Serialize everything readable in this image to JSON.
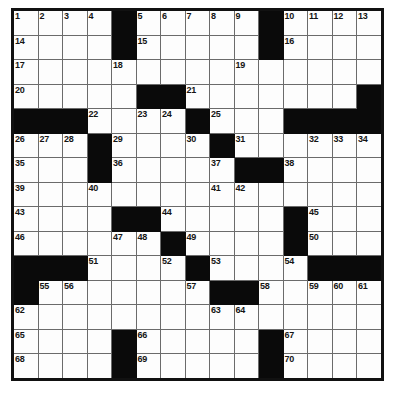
{
  "puzzle": {
    "type": "crossword-grid",
    "title": "",
    "rows": 15,
    "columns": 15,
    "colors": {
      "block": "#0a0a0a",
      "cell": "#fdfdfd",
      "grid_line": "#6b6b6b",
      "outer_border": "#111111",
      "number_text": "#141414"
    },
    "grid": [
      [
        {
          "block": false,
          "num": "1"
        },
        {
          "block": false,
          "num": "2"
        },
        {
          "block": false,
          "num": "3"
        },
        {
          "block": false,
          "num": "4"
        },
        {
          "block": true,
          "num": ""
        },
        {
          "block": false,
          "num": "5"
        },
        {
          "block": false,
          "num": "6"
        },
        {
          "block": false,
          "num": "7"
        },
        {
          "block": false,
          "num": "8"
        },
        {
          "block": false,
          "num": "9"
        },
        {
          "block": true,
          "num": ""
        },
        {
          "block": false,
          "num": "10"
        },
        {
          "block": false,
          "num": "11"
        },
        {
          "block": false,
          "num": "12"
        },
        {
          "block": false,
          "num": "13"
        }
      ],
      [
        {
          "block": false,
          "num": "14"
        },
        {
          "block": false,
          "num": ""
        },
        {
          "block": false,
          "num": ""
        },
        {
          "block": false,
          "num": ""
        },
        {
          "block": true,
          "num": ""
        },
        {
          "block": false,
          "num": "15"
        },
        {
          "block": false,
          "num": ""
        },
        {
          "block": false,
          "num": ""
        },
        {
          "block": false,
          "num": ""
        },
        {
          "block": false,
          "num": ""
        },
        {
          "block": true,
          "num": ""
        },
        {
          "block": false,
          "num": "16"
        },
        {
          "block": false,
          "num": ""
        },
        {
          "block": false,
          "num": ""
        },
        {
          "block": false,
          "num": ""
        }
      ],
      [
        {
          "block": false,
          "num": "17"
        },
        {
          "block": false,
          "num": ""
        },
        {
          "block": false,
          "num": ""
        },
        {
          "block": false,
          "num": ""
        },
        {
          "block": false,
          "num": "18"
        },
        {
          "block": false,
          "num": ""
        },
        {
          "block": false,
          "num": ""
        },
        {
          "block": false,
          "num": ""
        },
        {
          "block": false,
          "num": ""
        },
        {
          "block": false,
          "num": "19"
        },
        {
          "block": false,
          "num": ""
        },
        {
          "block": false,
          "num": ""
        },
        {
          "block": false,
          "num": ""
        },
        {
          "block": false,
          "num": ""
        },
        {
          "block": false,
          "num": ""
        }
      ],
      [
        {
          "block": false,
          "num": "20"
        },
        {
          "block": false,
          "num": ""
        },
        {
          "block": false,
          "num": ""
        },
        {
          "block": false,
          "num": ""
        },
        {
          "block": false,
          "num": ""
        },
        {
          "block": true,
          "num": ""
        },
        {
          "block": true,
          "num": ""
        },
        {
          "block": false,
          "num": "21"
        },
        {
          "block": false,
          "num": ""
        },
        {
          "block": false,
          "num": ""
        },
        {
          "block": false,
          "num": ""
        },
        {
          "block": false,
          "num": ""
        },
        {
          "block": false,
          "num": ""
        },
        {
          "block": false,
          "num": ""
        },
        {
          "block": true,
          "num": ""
        }
      ],
      [
        {
          "block": true,
          "num": ""
        },
        {
          "block": true,
          "num": ""
        },
        {
          "block": true,
          "num": ""
        },
        {
          "block": false,
          "num": "22"
        },
        {
          "block": false,
          "num": ""
        },
        {
          "block": false,
          "num": "23"
        },
        {
          "block": false,
          "num": "24"
        },
        {
          "block": true,
          "num": ""
        },
        {
          "block": false,
          "num": "25"
        },
        {
          "block": false,
          "num": ""
        },
        {
          "block": false,
          "num": ""
        },
        {
          "block": true,
          "num": ""
        },
        {
          "block": true,
          "num": ""
        },
        {
          "block": true,
          "num": ""
        },
        {
          "block": true,
          "num": ""
        }
      ],
      [
        {
          "block": false,
          "num": "26"
        },
        {
          "block": false,
          "num": "27"
        },
        {
          "block": false,
          "num": "28"
        },
        {
          "block": true,
          "num": ""
        },
        {
          "block": false,
          "num": "29"
        },
        {
          "block": false,
          "num": ""
        },
        {
          "block": false,
          "num": ""
        },
        {
          "block": false,
          "num": "30"
        },
        {
          "block": true,
          "num": ""
        },
        {
          "block": false,
          "num": "31"
        },
        {
          "block": false,
          "num": ""
        },
        {
          "block": false,
          "num": ""
        },
        {
          "block": false,
          "num": "32"
        },
        {
          "block": false,
          "num": "33"
        },
        {
          "block": false,
          "num": "34"
        }
      ],
      [
        {
          "block": false,
          "num": "35"
        },
        {
          "block": false,
          "num": ""
        },
        {
          "block": false,
          "num": ""
        },
        {
          "block": true,
          "num": ""
        },
        {
          "block": false,
          "num": "36"
        },
        {
          "block": false,
          "num": ""
        },
        {
          "block": false,
          "num": ""
        },
        {
          "block": false,
          "num": ""
        },
        {
          "block": false,
          "num": "37"
        },
        {
          "block": true,
          "num": ""
        },
        {
          "block": true,
          "num": ""
        },
        {
          "block": false,
          "num": "38"
        },
        {
          "block": false,
          "num": ""
        },
        {
          "block": false,
          "num": ""
        },
        {
          "block": false,
          "num": ""
        }
      ],
      [
        {
          "block": false,
          "num": "39"
        },
        {
          "block": false,
          "num": ""
        },
        {
          "block": false,
          "num": ""
        },
        {
          "block": false,
          "num": "40"
        },
        {
          "block": false,
          "num": ""
        },
        {
          "block": false,
          "num": ""
        },
        {
          "block": false,
          "num": ""
        },
        {
          "block": false,
          "num": ""
        },
        {
          "block": false,
          "num": "41"
        },
        {
          "block": false,
          "num": "42"
        },
        {
          "block": false,
          "num": ""
        },
        {
          "block": false,
          "num": ""
        },
        {
          "block": false,
          "num": ""
        },
        {
          "block": false,
          "num": ""
        },
        {
          "block": false,
          "num": ""
        }
      ],
      [
        {
          "block": false,
          "num": "43"
        },
        {
          "block": false,
          "num": ""
        },
        {
          "block": false,
          "num": ""
        },
        {
          "block": false,
          "num": ""
        },
        {
          "block": true,
          "num": ""
        },
        {
          "block": true,
          "num": ""
        },
        {
          "block": false,
          "num": "44"
        },
        {
          "block": false,
          "num": ""
        },
        {
          "block": false,
          "num": ""
        },
        {
          "block": false,
          "num": ""
        },
        {
          "block": false,
          "num": ""
        },
        {
          "block": true,
          "num": ""
        },
        {
          "block": false,
          "num": "45"
        },
        {
          "block": false,
          "num": ""
        },
        {
          "block": false,
          "num": ""
        }
      ],
      [
        {
          "block": false,
          "num": "46"
        },
        {
          "block": false,
          "num": ""
        },
        {
          "block": false,
          "num": ""
        },
        {
          "block": false,
          "num": ""
        },
        {
          "block": false,
          "num": "47"
        },
        {
          "block": false,
          "num": "48"
        },
        {
          "block": true,
          "num": ""
        },
        {
          "block": false,
          "num": "49"
        },
        {
          "block": false,
          "num": ""
        },
        {
          "block": false,
          "num": ""
        },
        {
          "block": false,
          "num": ""
        },
        {
          "block": true,
          "num": ""
        },
        {
          "block": false,
          "num": "50"
        },
        {
          "block": false,
          "num": ""
        },
        {
          "block": false,
          "num": ""
        }
      ],
      [
        {
          "block": true,
          "num": ""
        },
        {
          "block": true,
          "num": ""
        },
        {
          "block": true,
          "num": ""
        },
        {
          "block": false,
          "num": "51"
        },
        {
          "block": false,
          "num": ""
        },
        {
          "block": false,
          "num": ""
        },
        {
          "block": false,
          "num": "52"
        },
        {
          "block": true,
          "num": ""
        },
        {
          "block": false,
          "num": "53"
        },
        {
          "block": false,
          "num": ""
        },
        {
          "block": false,
          "num": ""
        },
        {
          "block": false,
          "num": "54"
        },
        {
          "block": true,
          "num": ""
        },
        {
          "block": true,
          "num": ""
        },
        {
          "block": true,
          "num": ""
        }
      ],
      [
        {
          "block": true,
          "num": ""
        },
        {
          "block": false,
          "num": "55"
        },
        {
          "block": false,
          "num": "56"
        },
        {
          "block": false,
          "num": ""
        },
        {
          "block": false,
          "num": ""
        },
        {
          "block": false,
          "num": ""
        },
        {
          "block": false,
          "num": ""
        },
        {
          "block": false,
          "num": "57"
        },
        {
          "block": true,
          "num": ""
        },
        {
          "block": true,
          "num": ""
        },
        {
          "block": false,
          "num": "58"
        },
        {
          "block": false,
          "num": ""
        },
        {
          "block": false,
          "num": "59"
        },
        {
          "block": false,
          "num": "60"
        },
        {
          "block": false,
          "num": "61"
        }
      ],
      [
        {
          "block": false,
          "num": "62"
        },
        {
          "block": false,
          "num": ""
        },
        {
          "block": false,
          "num": ""
        },
        {
          "block": false,
          "num": ""
        },
        {
          "block": false,
          "num": ""
        },
        {
          "block": false,
          "num": ""
        },
        {
          "block": false,
          "num": ""
        },
        {
          "block": false,
          "num": ""
        },
        {
          "block": false,
          "num": "63"
        },
        {
          "block": false,
          "num": "64"
        },
        {
          "block": false,
          "num": ""
        },
        {
          "block": false,
          "num": ""
        },
        {
          "block": false,
          "num": ""
        },
        {
          "block": false,
          "num": ""
        },
        {
          "block": false,
          "num": ""
        }
      ],
      [
        {
          "block": false,
          "num": "65"
        },
        {
          "block": false,
          "num": ""
        },
        {
          "block": false,
          "num": ""
        },
        {
          "block": false,
          "num": ""
        },
        {
          "block": true,
          "num": ""
        },
        {
          "block": false,
          "num": "66"
        },
        {
          "block": false,
          "num": ""
        },
        {
          "block": false,
          "num": ""
        },
        {
          "block": false,
          "num": ""
        },
        {
          "block": false,
          "num": ""
        },
        {
          "block": true,
          "num": ""
        },
        {
          "block": false,
          "num": "67"
        },
        {
          "block": false,
          "num": ""
        },
        {
          "block": false,
          "num": ""
        },
        {
          "block": false,
          "num": ""
        }
      ],
      [
        {
          "block": false,
          "num": "68"
        },
        {
          "block": false,
          "num": ""
        },
        {
          "block": false,
          "num": ""
        },
        {
          "block": false,
          "num": ""
        },
        {
          "block": true,
          "num": ""
        },
        {
          "block": false,
          "num": "69"
        },
        {
          "block": false,
          "num": ""
        },
        {
          "block": false,
          "num": ""
        },
        {
          "block": false,
          "num": ""
        },
        {
          "block": false,
          "num": ""
        },
        {
          "block": true,
          "num": ""
        },
        {
          "block": false,
          "num": "70"
        },
        {
          "block": false,
          "num": ""
        },
        {
          "block": false,
          "num": ""
        },
        {
          "block": false,
          "num": ""
        }
      ]
    ]
  }
}
